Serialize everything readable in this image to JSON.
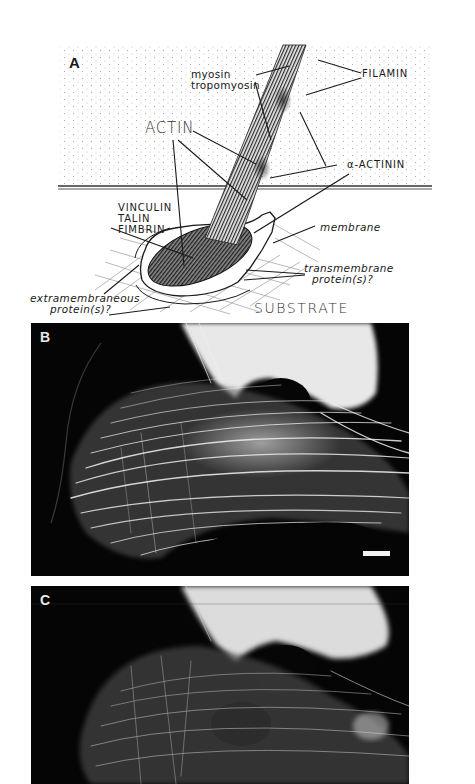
{
  "figure": {
    "panels": [
      {
        "id": "A",
        "type": "schematic-diagram",
        "letter": "A",
        "labels": {
          "myosin": "myosin",
          "tropomyosin": "tropomyosin",
          "filamin": "FILAMIN",
          "actin": "ACTIN",
          "alpha_actinin": "α-ACTININ",
          "vinculin": "VINCULIN",
          "talin": "TALIN",
          "fimbrin": "FIMBRIN",
          "membrane": "membrane",
          "transmembrane_1": "transmembrane",
          "transmembrane_2": "protein(s)?",
          "extramembraneous_1": "extramembraneous",
          "extramembraneous_2": "protein(s)?",
          "substrate": "SUBSTRATE"
        }
      },
      {
        "id": "B",
        "type": "fluorescence-micrograph",
        "letter": "B",
        "scale_bar": true
      },
      {
        "id": "C",
        "type": "fluorescence-micrograph",
        "letter": "C",
        "scale_bar": false
      }
    ]
  },
  "colors": {
    "ink": "#1a1a1a",
    "stipple": "#9a9a9a",
    "micrograph_bg": "#050505",
    "fluorescence": "#f0f0f0"
  }
}
